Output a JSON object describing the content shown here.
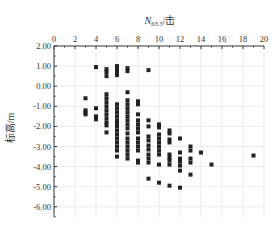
{
  "chart_data": {
    "type": "scatter",
    "title": "",
    "xlabel": "N63.5/击",
    "xlabel_main": "N",
    "xlabel_sub": "63.5",
    "xlabel_unit": "/击",
    "ylabel": "标高/m",
    "x_axis_position": "top",
    "xlim": [
      0,
      20
    ],
    "ylim": [
      -6.5,
      2.0
    ],
    "x_ticks": [
      0,
      2,
      4,
      6,
      8,
      10,
      12,
      14,
      16,
      18,
      20
    ],
    "x_tick_labels": [
      "0",
      "2",
      "4",
      "6",
      "8",
      "10",
      "12",
      "14",
      "16",
      "18",
      "20"
    ],
    "y_ticks": [
      2,
      1,
      0,
      -1,
      -2,
      -3,
      -4,
      -5,
      -6
    ],
    "y_tick_labels": [
      "2.00",
      "1.00",
      "0.00",
      "-1.00",
      "-2.00",
      "-3.00",
      "-4.00",
      "-5.00",
      "-6.00"
    ],
    "grid": true,
    "legend": null,
    "marker": "square",
    "marker_color": "#222222",
    "points": [
      [
        3,
        -0.6
      ],
      [
        3,
        -1.2
      ],
      [
        3,
        -1.3
      ],
      [
        3,
        -1.4
      ],
      [
        4,
        0.95
      ],
      [
        4,
        -1.1
      ],
      [
        4,
        -1.5
      ],
      [
        4,
        -1.65
      ],
      [
        5,
        0.85
      ],
      [
        5,
        0.7
      ],
      [
        5,
        0.5
      ],
      [
        5,
        -0.4
      ],
      [
        5,
        -0.6
      ],
      [
        5,
        -0.8
      ],
      [
        5,
        -1.0
      ],
      [
        5,
        -1.2
      ],
      [
        5,
        -1.4
      ],
      [
        5,
        -1.6
      ],
      [
        5,
        -1.8
      ],
      [
        5,
        -1.95
      ],
      [
        5,
        -2.3
      ],
      [
        6,
        1.0
      ],
      [
        6,
        0.85
      ],
      [
        6,
        0.7
      ],
      [
        6,
        0.55
      ],
      [
        6,
        -0.9
      ],
      [
        6,
        -1.1
      ],
      [
        6,
        -1.3
      ],
      [
        6,
        -1.5
      ],
      [
        6,
        -1.7
      ],
      [
        6,
        -1.85
      ],
      [
        6,
        -2.0
      ],
      [
        6,
        -2.2
      ],
      [
        6,
        -2.4
      ],
      [
        6,
        -2.6
      ],
      [
        6,
        -2.8
      ],
      [
        6,
        -3.0
      ],
      [
        6,
        -3.2
      ],
      [
        6,
        -3.5
      ],
      [
        7,
        0.9
      ],
      [
        7,
        0.75
      ],
      [
        7,
        -0.3
      ],
      [
        7,
        -0.7
      ],
      [
        7,
        -0.9
      ],
      [
        7,
        -1.1
      ],
      [
        7,
        -1.3
      ],
      [
        7,
        -1.5
      ],
      [
        7,
        -1.7
      ],
      [
        7,
        -1.9
      ],
      [
        7,
        -2.1
      ],
      [
        7,
        -2.35
      ],
      [
        7,
        -2.6
      ],
      [
        7,
        -2.8
      ],
      [
        7,
        -3.0
      ],
      [
        7,
        -3.2
      ],
      [
        7,
        -3.4
      ],
      [
        7,
        -3.6
      ],
      [
        8,
        -0.75
      ],
      [
        8,
        -0.9
      ],
      [
        8,
        -1.4
      ],
      [
        8,
        -1.7
      ],
      [
        8,
        -1.9
      ],
      [
        8,
        -2.1
      ],
      [
        8,
        -2.3
      ],
      [
        8,
        -2.6
      ],
      [
        8,
        -2.8
      ],
      [
        8,
        -3.0
      ],
      [
        8,
        -3.2
      ],
      [
        8,
        -3.7
      ],
      [
        8,
        -3.8
      ],
      [
        9,
        0.8
      ],
      [
        9,
        -1.7
      ],
      [
        9,
        -2.0
      ],
      [
        9,
        -2.5
      ],
      [
        9,
        -2.7
      ],
      [
        9,
        -2.95
      ],
      [
        9,
        -3.15
      ],
      [
        9,
        -3.4
      ],
      [
        9,
        -3.6
      ],
      [
        9,
        -3.8
      ],
      [
        9,
        -4.6
      ],
      [
        10,
        -1.9
      ],
      [
        10,
        -2.05
      ],
      [
        10,
        -2.4
      ],
      [
        10,
        -2.6
      ],
      [
        10,
        -2.8
      ],
      [
        10,
        -3.0
      ],
      [
        10,
        -3.2
      ],
      [
        10,
        -3.4
      ],
      [
        10,
        -3.9
      ],
      [
        10,
        -4.8
      ],
      [
        11,
        -2.2
      ],
      [
        11,
        -2.35
      ],
      [
        11,
        -2.65
      ],
      [
        11,
        -2.8
      ],
      [
        11,
        -3.4
      ],
      [
        11,
        -3.55
      ],
      [
        11,
        -3.7
      ],
      [
        11,
        -3.9
      ],
      [
        11,
        -4.95
      ],
      [
        12,
        -2.6
      ],
      [
        12,
        -3.3
      ],
      [
        12,
        -3.6
      ],
      [
        12,
        -3.75
      ],
      [
        12,
        -3.95
      ],
      [
        12,
        -4.2
      ],
      [
        12,
        -5.05
      ],
      [
        13,
        -3.0
      ],
      [
        13,
        -3.2
      ],
      [
        13,
        -3.6
      ],
      [
        13,
        -3.8
      ],
      [
        13,
        -4.4
      ],
      [
        14,
        -3.3
      ],
      [
        15,
        -3.9
      ],
      [
        19,
        -3.45
      ]
    ]
  }
}
